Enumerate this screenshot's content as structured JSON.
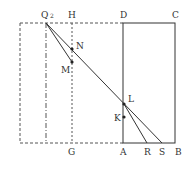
{
  "diagram": {
    "labels": {
      "Q": "Q",
      "Q_sub": "2",
      "H": "H",
      "D": "D",
      "C": "C",
      "N": "N",
      "M": "M",
      "L": "L",
      "K": "K",
      "G": "G",
      "A": "A",
      "R": "R",
      "S": "S",
      "B": "B"
    },
    "colors": {
      "line": "#333333",
      "dashed": "#555555"
    }
  }
}
